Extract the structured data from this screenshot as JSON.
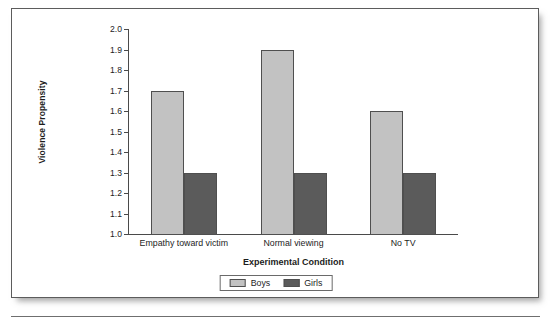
{
  "chart_data": {
    "type": "bar",
    "title": "",
    "xlabel": "Experimental Condition",
    "ylabel": "Violence Propensity",
    "categories": [
      "Empathy toward victim",
      "Normal viewing",
      "No TV"
    ],
    "series": [
      {
        "name": "Boys",
        "color": "#c2c2c2",
        "values": [
          1.7,
          1.9,
          1.6
        ]
      },
      {
        "name": "Girls",
        "color": "#5b5b5b",
        "values": [
          1.3,
          1.3,
          1.3
        ]
      }
    ],
    "ylim": [
      1.0,
      2.0
    ],
    "ytick_values": [
      1.0,
      1.1,
      1.2,
      1.3,
      1.4,
      1.5,
      1.6,
      1.7,
      1.8,
      1.9,
      2.0
    ],
    "ytick_labels": [
      "1.0",
      "1.1",
      "1.2",
      "1.3",
      "1.4",
      "1.5",
      "1.6",
      "1.7",
      "1.8",
      "1.9",
      "2.0"
    ],
    "grid": false,
    "legend_position": "bottom-center",
    "legend_entries": [
      "Boys",
      "Girls"
    ]
  },
  "figure": {
    "border_color": "#5c5c5c",
    "background": "#ffffff",
    "axis_color": "#4a4a4a",
    "text_color": "#1d1d1d"
  }
}
